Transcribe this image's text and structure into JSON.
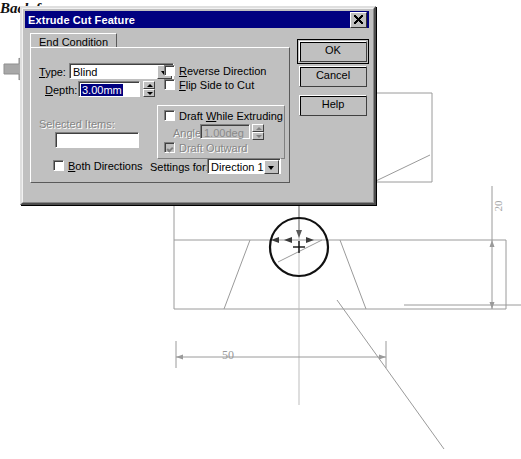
{
  "dialog": {
    "title": "Extrude Cut Feature",
    "close_icon": "close-icon",
    "tab": "End Condition",
    "type_label": "Type:",
    "type_value": "Blind",
    "depth_label": "Depth:",
    "depth_value": "3.00mm",
    "selected_items_label": "Selected Items:",
    "selected_items_value": "",
    "reverse_direction": "Reverse Direction",
    "flip_side_to_cut": "Flip Side to Cut",
    "draft_while_extruding": "Draft While Extruding",
    "angle_label": "Angle:",
    "angle_value": "1.00deg",
    "draft_outward": "Draft Outward",
    "both_directions": "Both Directions",
    "settings_for_label": "Settings for:",
    "settings_for_value": "Direction 1",
    "buttons": {
      "ok": "OK",
      "cancel": "Cancel",
      "help": "Help"
    }
  },
  "drawing": {
    "diameter_label": "Ø20",
    "width_label": "50",
    "height_label": "20",
    "annotation": "Back face",
    "cursor_icon": "arrow-right-cursor"
  },
  "colors": {
    "dialog_face": "#c0c0c0",
    "titlebar": "#000080",
    "selection": "#000080",
    "drawing_line": "#9a9a9a",
    "drawing_bold": "#111111"
  }
}
